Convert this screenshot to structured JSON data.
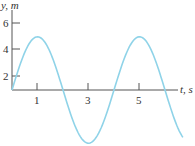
{
  "chart_data": {
    "type": "line",
    "title": "",
    "xlabel": "t, s",
    "ylabel": "y, m",
    "x_ticks": [
      "1",
      "3",
      "5"
    ],
    "y_ticks": [
      "2",
      "4",
      "6"
    ],
    "xlim": [
      0,
      6.8
    ],
    "ylim": [
      -4.5,
      6.8
    ],
    "grid": false,
    "series": [
      {
        "name": "y(t) = 4 sin(pi t / 2)",
        "color": "#8fd3e8",
        "x": [
          0,
          0.5,
          1,
          1.5,
          2,
          2.5,
          3,
          3.5,
          4,
          4.5,
          5,
          5.5,
          6,
          6.5,
          6.7
        ],
        "values": [
          0,
          2.83,
          4,
          2.83,
          0,
          -2.83,
          -4,
          -2.83,
          0,
          2.83,
          4,
          2.83,
          0,
          -2.83,
          -3.56
        ]
      }
    ]
  },
  "labels": {
    "y_axis": "y, m",
    "x_axis": "t, s",
    "x_tick_1": "1",
    "x_tick_3": "3",
    "x_tick_5": "5",
    "y_tick_2": "2",
    "y_tick_4": "4",
    "y_tick_6": "6"
  }
}
